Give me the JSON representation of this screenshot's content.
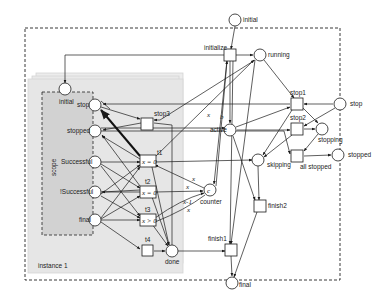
{
  "diagram": {
    "type": "petri-net",
    "colors": {
      "stroke": "#1a1a1a",
      "instance_fill": "#e8e8e8",
      "instance_border": "#d4d4d4",
      "scope_fill": "#d2d2d2",
      "background": "#ffffff"
    },
    "outer_places": {
      "initial": "initial",
      "running": "running",
      "active": "active",
      "skipping": "skipping",
      "stopping": "stopping",
      "stop": "stop",
      "stopped": "stopped",
      "counter": "counter",
      "counter_token": "c",
      "done": "done",
      "final": "final"
    },
    "outer_transitions": {
      "initialize": "initialize",
      "stop1": "stop1",
      "stop2": "stop2",
      "all_stopped": "all stopped",
      "finish1": "finish1",
      "finish2": "finish2"
    },
    "instance": {
      "label": "instance 1",
      "scope_label": "scope",
      "places": {
        "initial": "initial",
        "stop": "stop",
        "stopped": "stopped",
        "successful": "Successful",
        "not_successful": "!Successful",
        "final": "final"
      },
      "transitions": {
        "stop3": "stop3",
        "t1": "t1",
        "t2": "t2",
        "t3": "t3",
        "t4": "t4"
      },
      "guards": {
        "t1": "x = 0",
        "t2": "x = 0",
        "t3": "x > 0"
      }
    },
    "arc_labels": {
      "x_init": "x",
      "b_init": "b",
      "x_t1": "x",
      "x_t2": "x",
      "x_t2b": "x",
      "xm1_t3": "x-1",
      "x_t3": "x"
    }
  }
}
